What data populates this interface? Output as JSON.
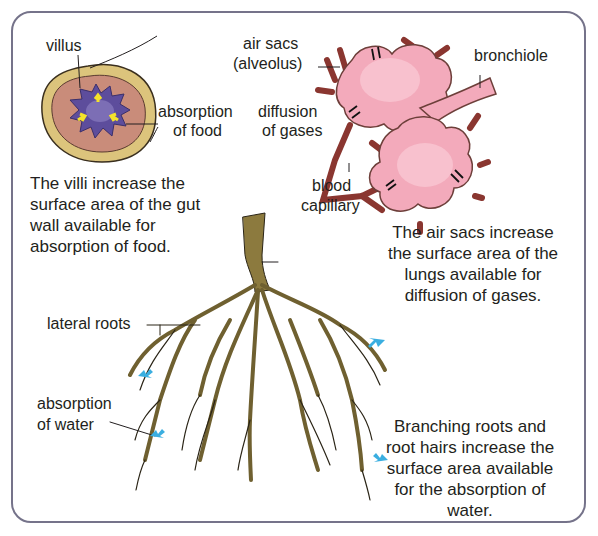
{
  "gut": {
    "labels": {
      "villus": "villus",
      "absorption_line1": "absorption",
      "absorption_line2": "of food"
    },
    "caption": [
      "The villi increase the",
      "surface area of the gut",
      "wall available for",
      "absorption of food."
    ],
    "colors": {
      "outer_wall": "#d9c27a",
      "inner_wall": "#c98a78",
      "lumen": "#5b4a9a",
      "arrows": "#f5e32a"
    }
  },
  "lungs": {
    "labels": {
      "air_sacs_line1": "air sacs",
      "air_sacs_line2": "(alveolus)",
      "bronchiole": "bronchiole",
      "diffusion_line1": "diffusion",
      "diffusion_line2": "of gases",
      "blood_line1": "blood",
      "blood_line2": "capillary"
    },
    "caption": [
      "The air sacs increase",
      "the surface area of the",
      "lungs available for",
      "diffusion of gases."
    ],
    "colors": {
      "alveoli": "#f2a7b8",
      "capillary": "#a4423c"
    }
  },
  "roots": {
    "labels": {
      "lateral_roots": "lateral roots",
      "absorption_line1": "absorption",
      "absorption_line2": "of water"
    },
    "caption": [
      "Branching roots and",
      "root hairs increase the",
      "surface area available",
      "for the absorption of",
      "water."
    ],
    "colors": {
      "root": "#8c7a3e",
      "arrows": "#3aaee0"
    }
  }
}
